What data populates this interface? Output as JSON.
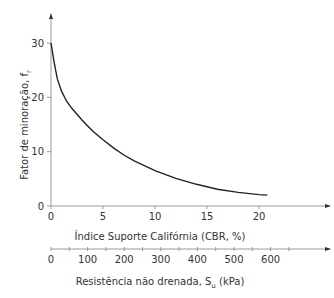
{
  "chart_data": {
    "type": "line",
    "title": "",
    "ylabel": "Fator de minoração, f",
    "ylabel_subscript": "r",
    "xlabel": "Índice Suporte Califórnia (CBR, %)",
    "x2label": "Resistência não drenada, S",
    "x2label_subscript": "u",
    "x2label_suffix": " (kPa)",
    "ylim": [
      0,
      35
    ],
    "xlim": [
      0,
      24
    ],
    "yticks": [
      "0",
      "10",
      "20",
      "30"
    ],
    "xticks": [
      "0",
      "5",
      "10",
      "15",
      "20"
    ],
    "x2ticks": [
      "0",
      "100",
      "200",
      "300",
      "400",
      "500",
      "600"
    ],
    "grid": false,
    "series": [
      {
        "name": "Fator de minoração",
        "x": [
          0,
          0.3,
          0.6,
          1,
          1.5,
          2,
          3,
          4,
          5,
          6,
          7,
          8,
          10,
          12,
          14,
          16,
          18,
          20,
          20.8
        ],
        "values": [
          30,
          26.5,
          23.5,
          21.2,
          19.3,
          18,
          15.8,
          13.8,
          12.2,
          10.7,
          9.4,
          8.3,
          6.5,
          5.1,
          4.0,
          3.1,
          2.5,
          2.1,
          2.0
        ]
      }
    ]
  }
}
